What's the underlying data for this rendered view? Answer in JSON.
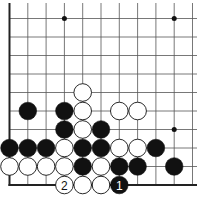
{
  "board": {
    "columns": 11,
    "rows": 10,
    "edges": [
      "left",
      "bottom"
    ],
    "star_points": [
      [
        3,
        0
      ],
      [
        9,
        0
      ],
      [
        9,
        6
      ]
    ],
    "stones": [
      {
        "col": 4,
        "row": 4,
        "color": "white"
      },
      {
        "col": 1,
        "row": 5,
        "color": "black"
      },
      {
        "col": 3,
        "row": 5,
        "color": "black"
      },
      {
        "col": 4,
        "row": 5,
        "color": "white"
      },
      {
        "col": 6,
        "row": 5,
        "color": "white"
      },
      {
        "col": 7,
        "row": 5,
        "color": "white"
      },
      {
        "col": 3,
        "row": 6,
        "color": "black"
      },
      {
        "col": 4,
        "row": 6,
        "color": "white"
      },
      {
        "col": 5,
        "row": 6,
        "color": "black"
      },
      {
        "col": 0,
        "row": 7,
        "color": "black"
      },
      {
        "col": 1,
        "row": 7,
        "color": "black"
      },
      {
        "col": 2,
        "row": 7,
        "color": "black"
      },
      {
        "col": 3,
        "row": 7,
        "color": "white"
      },
      {
        "col": 4,
        "row": 7,
        "color": "black"
      },
      {
        "col": 5,
        "row": 7,
        "color": "black"
      },
      {
        "col": 6,
        "row": 7,
        "color": "white"
      },
      {
        "col": 7,
        "row": 7,
        "color": "white"
      },
      {
        "col": 8,
        "row": 7,
        "color": "black"
      },
      {
        "col": 0,
        "row": 8,
        "color": "white"
      },
      {
        "col": 1,
        "row": 8,
        "color": "white"
      },
      {
        "col": 2,
        "row": 8,
        "color": "white"
      },
      {
        "col": 3,
        "row": 8,
        "color": "white"
      },
      {
        "col": 4,
        "row": 8,
        "color": "black"
      },
      {
        "col": 5,
        "row": 8,
        "color": "white"
      },
      {
        "col": 6,
        "row": 8,
        "color": "black"
      },
      {
        "col": 7,
        "row": 8,
        "color": "black"
      },
      {
        "col": 9,
        "row": 8,
        "color": "black"
      },
      {
        "col": 3,
        "row": 9,
        "color": "white",
        "label": "2"
      },
      {
        "col": 4,
        "row": 9,
        "color": "white"
      },
      {
        "col": 5,
        "row": 9,
        "color": "white"
      },
      {
        "col": 6,
        "row": 9,
        "color": "black",
        "label": "1"
      }
    ]
  }
}
